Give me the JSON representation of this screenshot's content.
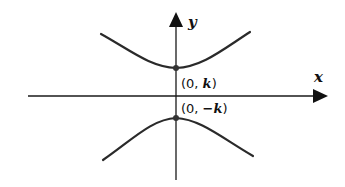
{
  "diagram": {
    "type": "hyperbola",
    "axes": {
      "x_label": "x",
      "y_label": "y"
    },
    "vertices": [
      {
        "label_prefix": "(0, ",
        "label_var": "k",
        "label_suffix": ")",
        "position": "upper"
      },
      {
        "label_prefix": "(0, ",
        "label_var": "−k",
        "label_suffix": ")",
        "position": "lower"
      }
    ],
    "branches": [
      "upper",
      "lower"
    ]
  }
}
